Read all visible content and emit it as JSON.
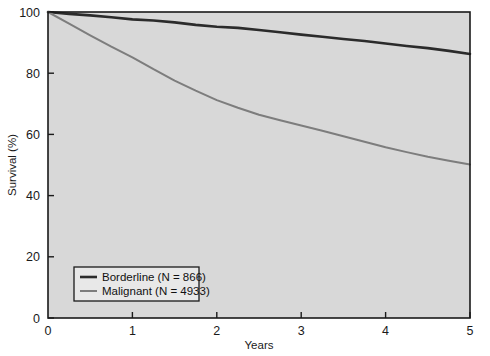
{
  "chart_data": {
    "type": "line",
    "title": "",
    "subtitle": "",
    "xlabel": "Years",
    "ylabel": "Survival (%)",
    "xlim": [
      0,
      5
    ],
    "ylim": [
      0,
      100
    ],
    "xticks": [
      0,
      1,
      2,
      3,
      4,
      5
    ],
    "xtick_labels": [
      "0",
      "1",
      "2",
      "3",
      "4",
      "5"
    ],
    "yticks": [
      0,
      20,
      40,
      60,
      80,
      100
    ],
    "ytick_labels": [
      "0",
      "20",
      "40",
      "60",
      "80",
      "100"
    ],
    "grid": false,
    "legend_position": "lower left",
    "plot_background": "#d8d8d8",
    "figure_background": "#ffffff",
    "axis_color": "#1a1a1a",
    "series": [
      {
        "name": "Borderline (N = 866)",
        "label": "Borderline (N = 866)",
        "n": 866,
        "color": "#2b2b2b",
        "line_width": 2.6,
        "x": [
          0,
          0.25,
          0.5,
          0.75,
          1.0,
          1.25,
          1.5,
          1.75,
          2.0,
          2.25,
          2.5,
          2.75,
          3.0,
          3.25,
          3.5,
          3.75,
          4.0,
          4.25,
          4.5,
          4.75,
          5.0
        ],
        "y": [
          100,
          99.4,
          98.9,
          98.3,
          97.6,
          97.2,
          96.6,
          95.8,
          95.2,
          94.8,
          94.1,
          93.4,
          92.6,
          91.9,
          91.2,
          90.5,
          89.7,
          88.9,
          88.2,
          87.3,
          86.3
        ]
      },
      {
        "name": "Malignant (N = 4933)",
        "label": "Malignant (N = 4933)",
        "n": 4933,
        "color": "#7d7d7d",
        "line_width": 2.0,
        "x": [
          0,
          0.25,
          0.5,
          0.75,
          1.0,
          1.25,
          1.5,
          1.75,
          2.0,
          2.25,
          2.5,
          2.75,
          3.0,
          3.25,
          3.5,
          3.75,
          4.0,
          4.25,
          4.5,
          4.75,
          5.0
        ],
        "y": [
          100,
          96.2,
          92.4,
          88.7,
          85.2,
          81.3,
          77.6,
          74.3,
          71.2,
          68.7,
          66.4,
          64.6,
          62.9,
          61.2,
          59.4,
          57.6,
          55.8,
          54.2,
          52.7,
          51.4,
          50.2
        ]
      }
    ]
  },
  "legend": {
    "entries": [
      {
        "label": "Borderline (N = 866)",
        "color": "#2b2b2b"
      },
      {
        "label": "Malignant (N = 4933)",
        "color": "#7d7d7d"
      }
    ]
  },
  "axes": {
    "x_title": "Years",
    "y_title": "Survival (%)",
    "x_ticks": [
      "0",
      "1",
      "2",
      "3",
      "4",
      "5"
    ],
    "y_ticks": [
      "0",
      "20",
      "40",
      "60",
      "80",
      "100"
    ]
  }
}
